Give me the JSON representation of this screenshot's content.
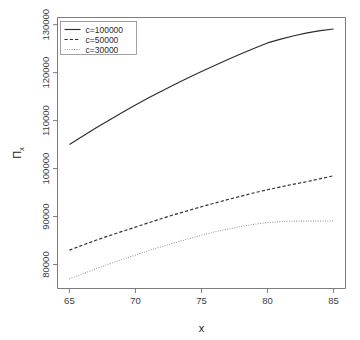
{
  "chart_data": {
    "type": "line",
    "title": "",
    "xlabel": "x",
    "ylabel": "Π",
    "ylabel_sub": "x",
    "xlim": [
      64.1,
      85.9
    ],
    "ylim": [
      75000,
      131500
    ],
    "xticks": [
      65,
      70,
      75,
      80,
      85
    ],
    "xtick_labels": [
      "65",
      "70",
      "75",
      "80",
      "85"
    ],
    "yticks": [
      80000,
      90000,
      100000,
      110000,
      120000,
      130000
    ],
    "ytick_labels": [
      "80000",
      "90000",
      "100000",
      "110000",
      "120000",
      "130000"
    ],
    "grid": false,
    "legend_position": "top-left",
    "x": [
      65,
      66,
      67,
      68,
      69,
      70,
      71,
      72,
      73,
      74,
      75,
      76,
      77,
      78,
      79,
      80,
      81,
      82,
      83,
      84,
      85
    ],
    "series": [
      {
        "name": "c=100000",
        "style": "solid",
        "color": "#2d2d2d",
        "values": [
          105000,
          106750,
          108450,
          110100,
          111700,
          113250,
          114750,
          116200,
          117600,
          118950,
          120250,
          121500,
          122750,
          123950,
          125100,
          126200,
          127000,
          127700,
          128300,
          128750,
          129100
        ]
      },
      {
        "name": "c=50000",
        "style": "dashed",
        "color": "#2d2d2d",
        "values": [
          83000,
          84050,
          85050,
          86000,
          86900,
          87800,
          88700,
          89600,
          90450,
          91250,
          92050,
          92800,
          93550,
          94250,
          94950,
          95600,
          96200,
          96750,
          97300,
          97900,
          98500
        ]
      },
      {
        "name": "c=30000",
        "style": "dotted",
        "color": "#8f8f8f",
        "values": [
          77000,
          78050,
          79100,
          80100,
          81050,
          82000,
          82900,
          83750,
          84550,
          85350,
          86100,
          86800,
          87400,
          87950,
          88400,
          88750,
          88950,
          89050,
          89050,
          89050,
          89100
        ]
      }
    ]
  },
  "legend": {
    "entries": [
      {
        "label": "c=100000",
        "style": "solid"
      },
      {
        "label": "c=50000",
        "style": "dashed"
      },
      {
        "label": "c=30000",
        "style": "dotted"
      }
    ]
  }
}
